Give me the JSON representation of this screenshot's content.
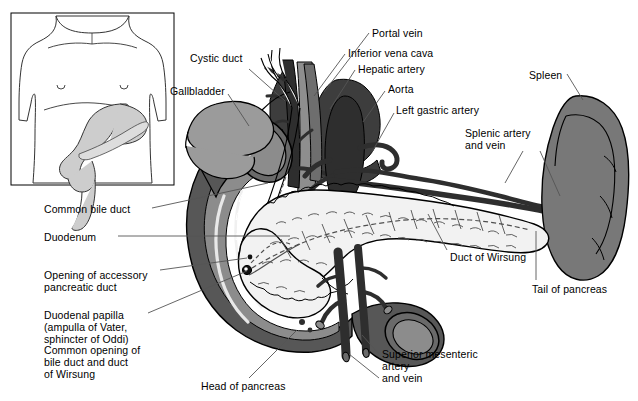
{
  "figure": {
    "width": 638,
    "height": 401,
    "background": "#ffffff"
  },
  "inset": {
    "name": "torso-orientation-inset",
    "description": "Line drawing of a human torso showing the stomach and duodenum in situ",
    "border_color": "#000000",
    "fill": "#ffffff",
    "organ_fill": "#cccccc"
  },
  "palette": {
    "outline": "#000000",
    "pancreas": "#f2f2f2",
    "pancreas_texture": "#5a5a5a",
    "duodenum_wall": "#575757",
    "duodenum_lumen": "#8c8c8c",
    "gallbladder": "#9b9b9b",
    "spleen": "#787878",
    "liver_dark": "#3d3d3d",
    "vessel_dark": "#2e2e2e",
    "vessel_mid": "#6b6b6b",
    "vena_cava": "#8c8c8c",
    "leader_line": "#555555",
    "text": "#000000"
  },
  "labels": [
    {
      "id": "cystic-duct",
      "text": "Cystic duct",
      "x": 190,
      "y": 53,
      "align": "left"
    },
    {
      "id": "gallbladder",
      "text": "Gallbladder",
      "x": 170,
      "y": 86,
      "align": "left"
    },
    {
      "id": "portal-vein",
      "text": "Portal vein",
      "x": 372,
      "y": 28,
      "align": "left"
    },
    {
      "id": "inferior-vena-cava",
      "text": "Inferior vena cava",
      "x": 348,
      "y": 48,
      "align": "left"
    },
    {
      "id": "hepatic-artery",
      "text": "Hepatic artery",
      "x": 358,
      "y": 64,
      "align": "left"
    },
    {
      "id": "aorta",
      "text": "Aorta",
      "x": 388,
      "y": 84,
      "align": "left"
    },
    {
      "id": "left-gastric-artery",
      "text": "Left gastric artery",
      "x": 396,
      "y": 105,
      "align": "left"
    },
    {
      "id": "spleen",
      "text": "Spleen",
      "x": 529,
      "y": 70,
      "align": "left"
    },
    {
      "id": "splenic-artery-and-vein",
      "text": "Splenic artery\nand vein",
      "x": 465,
      "y": 128,
      "align": "left"
    },
    {
      "id": "common-bile-duct",
      "text": "Common bile duct",
      "x": 44,
      "y": 204,
      "align": "left"
    },
    {
      "id": "duodenum",
      "text": "Duodenum",
      "x": 44,
      "y": 232,
      "align": "left"
    },
    {
      "id": "opening-of-accessory-pancreatic-duct",
      "text": "Opening of accessory\npancreatic duct",
      "x": 44,
      "y": 270,
      "align": "left"
    },
    {
      "id": "duodenal-papilla",
      "text": "Duodenal papilla\n(ampulla of Vater,\nsphincter of Oddi)\nCommon opening of\nbile duct and duct\nof Wirsung",
      "x": 44,
      "y": 310,
      "align": "left"
    },
    {
      "id": "duct-of-wirsung",
      "text": "Duct of Wirsung",
      "x": 450,
      "y": 252,
      "align": "left"
    },
    {
      "id": "tail-of-pancreas",
      "text": "Tail of pancreas",
      "x": 532,
      "y": 284,
      "align": "left"
    },
    {
      "id": "superior-mesenteric-artery-and-vein",
      "text": "Superior mesenteric\nartery\nand vein",
      "x": 382,
      "y": 349,
      "align": "left"
    },
    {
      "id": "head-of-pancreas",
      "text": "Head of pancreas",
      "x": 201,
      "y": 381,
      "align": "left"
    }
  ],
  "leaders": [
    {
      "id": "leader-cystic-duct",
      "points": "249,69 285,101"
    },
    {
      "id": "leader-gallbladder",
      "points": "228,94 249,126"
    },
    {
      "id": "leader-portal-vein",
      "points": "369,33 324,92"
    },
    {
      "id": "leader-inferior-vena-cava",
      "points": "345,54 314,96"
    },
    {
      "id": "leader-hepatic-artery",
      "points": "355,70 330,109"
    },
    {
      "id": "leader-aorta",
      "points": "385,91 363,122"
    },
    {
      "id": "leader-left-gastric-artery",
      "points": "394,113 372,152"
    },
    {
      "id": "leader-spleen",
      "points": "567,74 583,100"
    },
    {
      "id": "leader-splenic-artery",
      "points": "523,151 505,183"
    },
    {
      "id": "leader-splenic-vein",
      "points": "540,151 560,196"
    },
    {
      "id": "leader-common-bile-duct",
      "points": "152,208 268,183"
    },
    {
      "id": "leader-duodenum",
      "points": "118,236 290,236"
    },
    {
      "id": "leader-accessory-duct",
      "points": "160,270 247,258"
    },
    {
      "id": "leader-duodenal-papilla",
      "points": "148,313 247,271"
    },
    {
      "id": "leader-duct-of-wirsung",
      "points": "447,250 428,214"
    },
    {
      "id": "leader-tail-of-pancreas",
      "points": "536,280 536,231"
    },
    {
      "id": "leader-superior-mesenteric-artery",
      "points": "379,354 362,335"
    },
    {
      "id": "leader-superior-mesenteric-vein",
      "points": "379,378 349,354"
    },
    {
      "id": "leader-head-of-pancreas",
      "points": "249,378 297,330"
    }
  ]
}
